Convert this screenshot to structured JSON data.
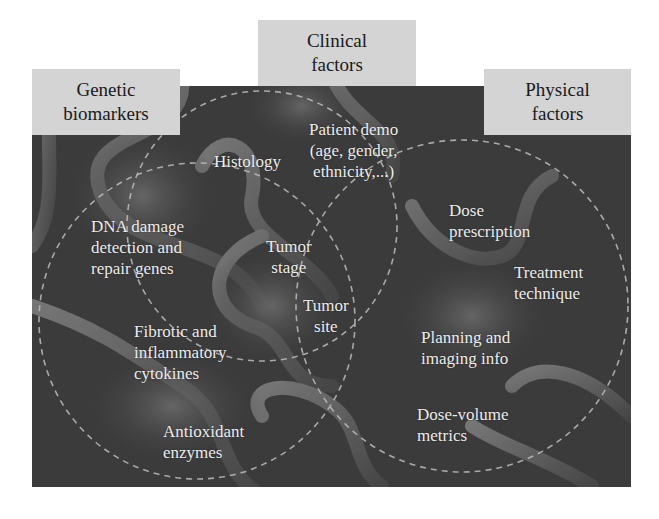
{
  "categories": {
    "genetic": {
      "line1": "Genetic",
      "line2": "biomarkers"
    },
    "clinical": {
      "line1": "Clinical",
      "line2": "factors"
    },
    "physical": {
      "line1": "Physical",
      "line2": "factors"
    }
  },
  "items": {
    "histology": {
      "line1": "Histology"
    },
    "patient_demo": {
      "line1": "Patient demo",
      "line2": "(age, gender,",
      "line3": "ethnicity,...)"
    },
    "dna_damage": {
      "line1": "DNA damage",
      "line2": "detection and",
      "line3": "repair genes"
    },
    "tumor_stage": {
      "line1": "Tumor",
      "line2": "stage"
    },
    "tumor_site": {
      "line1": "Tumor",
      "line2": "site"
    },
    "dose_prescription": {
      "line1": "Dose",
      "line2": "prescription"
    },
    "treatment_technique": {
      "line1": "Treatment",
      "line2": "technique"
    },
    "fibrotic": {
      "line1": "Fibrotic and",
      "line2": "inflammatory",
      "line3": "cytokines"
    },
    "planning_imaging": {
      "line1": "Planning and",
      "line2": "imaging info"
    },
    "dose_volume": {
      "line1": "Dose-volume",
      "line2": "metrics"
    },
    "antioxidant": {
      "line1": "Antioxidant",
      "line2": "enzymes"
    }
  },
  "colors": {
    "panel_background": "#3b3b3b",
    "label_box": "#d4d4d4",
    "item_text": "#ececec",
    "dashed_circle": "#bdbdbd"
  }
}
